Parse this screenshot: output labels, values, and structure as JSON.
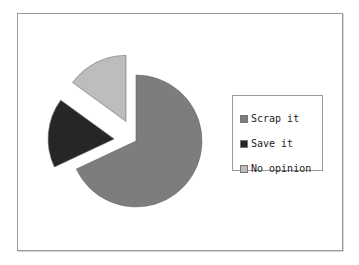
{
  "chart_data": {
    "type": "pie",
    "title": "",
    "categories": [
      "Scrap it",
      "Save it",
      "No opinion"
    ],
    "values": [
      68,
      17,
      15
    ],
    "unit": "percent (estimated)",
    "colors": [
      "#7d7d7d",
      "#262626",
      "#bdbdbd"
    ],
    "exploded": [
      false,
      true,
      true
    ],
    "start_angle_deg": 0,
    "direction": "clockwise",
    "legend_position": "right"
  },
  "legend": {
    "items": [
      {
        "label": "Scrap it",
        "color": "#7d7d7d"
      },
      {
        "label": "Save it",
        "color": "#262626"
      },
      {
        "label": "No opinion",
        "color": "#bdbdbd"
      }
    ]
  }
}
